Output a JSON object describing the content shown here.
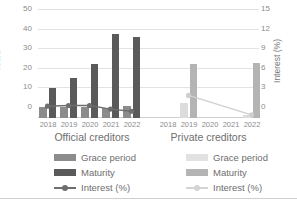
{
  "chart_data": {
    "type": "bar",
    "title": "",
    "xlabel": "",
    "ylabel": "Years",
    "y2label": "Interest (%)",
    "ylim": [
      0,
      50
    ],
    "y2lim": [
      0,
      15
    ],
    "yticks": [
      0,
      10,
      20,
      30,
      40,
      50
    ],
    "y2ticks": [
      0,
      3,
      6,
      9,
      12,
      15
    ],
    "grid": true,
    "legend_position": "bottom",
    "categories": [
      "2018",
      "2019",
      "2020",
      "2021",
      "2022"
    ],
    "panels": [
      {
        "name": "Official creditors",
        "title": "Official creditors",
        "series": [
          {
            "name": "Grace period",
            "axis": "left",
            "type": "bar",
            "color": "#8c8c8c",
            "values": [
              5.0,
              5.0,
              5.0,
              4.8,
              5.5
            ]
          },
          {
            "name": "Maturity",
            "axis": "left",
            "type": "bar",
            "color": "#5a5a5a",
            "values": [
              14.0,
              18.7,
              25.0,
              39.0,
              37.5
            ]
          },
          {
            "name": "Interest (%)",
            "axis": "right",
            "type": "line",
            "color": "#6e6e6e",
            "values": [
              1.5,
              1.6,
              1.6,
              1.1,
              0.8
            ]
          }
        ]
      },
      {
        "name": "Private creditors",
        "title": "Private creditors",
        "series": [
          {
            "name": "Grace period",
            "axis": "left",
            "type": "bar",
            "color": "#dcdcdc",
            "values": [
              0,
              6.8,
              0,
              0,
              1.5
            ]
          },
          {
            "name": "Maturity",
            "axis": "left",
            "type": "bar",
            "color": "#b4b4b4",
            "values": [
              0,
              25.0,
              0,
              0,
              25.3
            ]
          },
          {
            "name": "Interest (%)",
            "axis": "right",
            "type": "line",
            "color": "#cfcfcf",
            "values": [
              null,
              3.0,
              null,
              null,
              0.3
            ]
          }
        ]
      }
    ]
  },
  "axes": {
    "left_title": "Years",
    "right_title": "Interest (%)",
    "left_ticks": [
      "50",
      "40",
      "30",
      "20",
      "10",
      "0"
    ],
    "right_ticks": [
      "15",
      "12",
      "9",
      "6",
      "3",
      "0"
    ]
  },
  "categories": [
    "2018",
    "2019",
    "2020",
    "2021",
    "2022"
  ],
  "groups": {
    "official_title": "Official creditors",
    "private_title": "Private creditors"
  },
  "legend": {
    "official": {
      "grace": "Grace period",
      "maturity": "Maturity",
      "interest": "Interest (%)"
    },
    "private": {
      "grace": "Grace period",
      "maturity": "Maturity",
      "interest": "Interest (%)"
    }
  },
  "colors": {
    "official_grace": "#8c8c8c",
    "official_maturity": "#5a5a5a",
    "official_interest": "#6e6e6e",
    "private_grace": "#dcdcdc",
    "private_maturity": "#b4b4b4",
    "private_interest": "#cfcfcf",
    "gridline": "#e3e3e3",
    "text": "#6e6e6e"
  }
}
